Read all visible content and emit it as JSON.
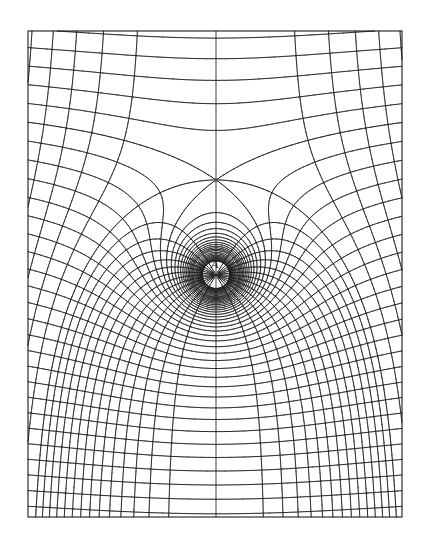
{
  "figure": {
    "type": "field-plot",
    "point_label": "A",
    "colors": {
      "ink": "#1a1a1a",
      "background": "#ffffff"
    }
  },
  "geometry": {
    "frame": {
      "left": 28,
      "top": 31,
      "right": 402,
      "bottom": 517
    },
    "source": {
      "x": 216,
      "y": 275
    },
    "label_position": {
      "x": 211,
      "y": 268
    },
    "stagnation_point": {
      "x": 216,
      "y": 180
    },
    "stagnation_distance": 95
  },
  "contours": {
    "equipotential_spacing": 17,
    "equipotential_near_extra_levels": 10,
    "stream_levels_outer_count": 13,
    "stream_levels_inner_count": 14,
    "separatrix_style": "dash-dot"
  },
  "chart_data": {
    "type": "diagram",
    "title": "",
    "elements": [
      {
        "kind": "frame",
        "bounds": [
          28,
          31,
          402,
          517
        ]
      },
      {
        "kind": "point",
        "label": "A",
        "x": 216,
        "y": 275
      },
      {
        "kind": "saddle",
        "x": 216,
        "y": 180
      },
      {
        "kind": "separatrix-equipotential",
        "style": "dash-dot",
        "edge_y": 120
      },
      {
        "kind": "separatrix-streamline",
        "style": "dash-dot",
        "bottom_x": [
          33,
          390
        ]
      }
    ]
  }
}
